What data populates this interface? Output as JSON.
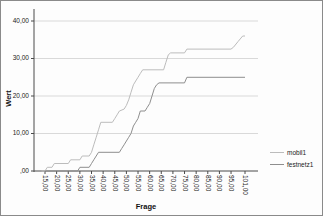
{
  "colors": {
    "axis": "#4a4a4a",
    "grid": "#d9d9d9",
    "tick_text": "#1a1a1a",
    "series_mobil1": "#bcbcbc",
    "series_festnetz1": "#8e8e8e"
  },
  "chart_data": {
    "type": "line",
    "title": "",
    "xlabel": "Frage",
    "ylabel": "Wert",
    "grid": "horizontal",
    "legend_position": "right",
    "xlim": [
      10,
      107
    ],
    "ylim": [
      0,
      43
    ],
    "x_ticks": [
      {
        "label": "15,00",
        "v": 15
      },
      {
        "label": "20,00",
        "v": 20
      },
      {
        "label": "25,00",
        "v": 25
      },
      {
        "label": "30,00",
        "v": 30
      },
      {
        "label": "35,00",
        "v": 35
      },
      {
        "label": "40,00",
        "v": 40
      },
      {
        "label": "45,00",
        "v": 45
      },
      {
        "label": "50,00",
        "v": 50
      },
      {
        "label": "55,00",
        "v": 55
      },
      {
        "label": "60,00",
        "v": 60
      },
      {
        "label": "65,00",
        "v": 65
      },
      {
        "label": "70,00",
        "v": 70
      },
      {
        "label": "75,00",
        "v": 75
      },
      {
        "label": "80,00",
        "v": 80
      },
      {
        "label": "85,00",
        "v": 85
      },
      {
        "label": "90,00",
        "v": 90
      },
      {
        "label": "95,00",
        "v": 95
      },
      {
        "label": "101,00",
        "v": 101
      }
    ],
    "y_ticks": [
      {
        "label": "40,00",
        "v": 40
      },
      {
        "label": "30,00",
        "v": 30
      },
      {
        "label": "20,00",
        "v": 20
      },
      {
        "label": "10,00",
        "v": 10
      },
      {
        "label": ",00",
        "v": 0
      }
    ],
    "series": [
      {
        "name": "mobil1",
        "color_key": "series_mobil1",
        "points": [
          [
            13.5,
            0
          ],
          [
            15,
            0
          ],
          [
            16,
            1
          ],
          [
            18,
            1
          ],
          [
            19,
            2
          ],
          [
            25,
            2
          ],
          [
            26,
            3
          ],
          [
            30,
            3
          ],
          [
            31,
            4
          ],
          [
            34,
            4
          ],
          [
            35,
            5
          ],
          [
            36,
            7
          ],
          [
            37,
            9
          ],
          [
            38,
            11
          ],
          [
            39,
            13
          ],
          [
            44,
            13
          ],
          [
            45,
            14
          ],
          [
            46,
            15
          ],
          [
            47,
            16
          ],
          [
            49,
            16.5
          ],
          [
            50,
            17.5
          ],
          [
            51,
            19
          ],
          [
            52,
            21
          ],
          [
            53,
            23
          ],
          [
            54,
            24
          ],
          [
            55,
            25
          ],
          [
            56,
            26
          ],
          [
            57,
            27
          ],
          [
            66,
            27
          ],
          [
            67,
            29
          ],
          [
            68,
            31
          ],
          [
            69,
            31.5
          ],
          [
            75,
            31.5
          ],
          [
            76,
            32.5
          ],
          [
            95,
            32.5
          ],
          [
            96,
            33
          ],
          [
            98,
            34.5
          ],
          [
            100,
            36
          ],
          [
            101,
            36
          ]
        ]
      },
      {
        "name": "festnetz1",
        "color_key": "series_festnetz1",
        "points": [
          [
            15,
            0
          ],
          [
            29,
            0
          ],
          [
            30,
            1
          ],
          [
            34,
            1
          ],
          [
            35,
            2
          ],
          [
            36,
            3
          ],
          [
            37,
            4
          ],
          [
            38,
            5
          ],
          [
            47,
            5
          ],
          [
            48,
            6
          ],
          [
            49,
            7
          ],
          [
            50,
            8
          ],
          [
            51,
            9
          ],
          [
            52,
            10
          ],
          [
            53,
            12
          ],
          [
            54,
            13
          ],
          [
            55,
            14
          ],
          [
            56,
            16
          ],
          [
            58,
            16
          ],
          [
            59,
            17
          ],
          [
            60,
            18
          ],
          [
            61,
            20
          ],
          [
            62,
            22
          ],
          [
            63,
            23
          ],
          [
            64,
            23.5
          ],
          [
            75,
            23.5
          ],
          [
            76,
            25
          ],
          [
            101,
            25
          ]
        ]
      }
    ]
  }
}
